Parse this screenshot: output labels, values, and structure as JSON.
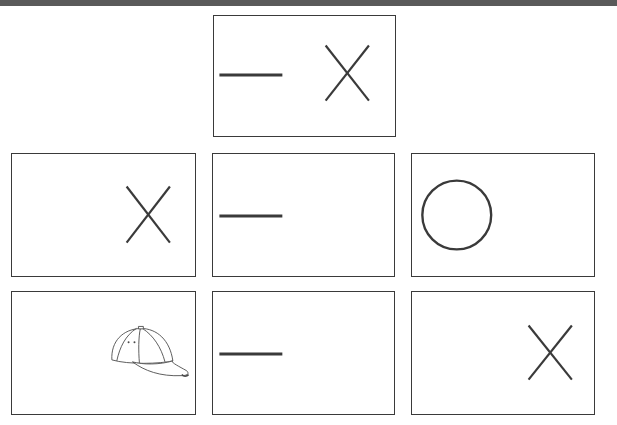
{
  "colors": {
    "stroke": "#3a3a3a",
    "top_bar": "#5a5a5a"
  },
  "top_card": {
    "label": "Example: dash and X",
    "symbols": [
      "dash",
      "x"
    ]
  },
  "grid": [
    {
      "label": "X",
      "symbol": "x"
    },
    {
      "label": "Dash",
      "symbol": "dash"
    },
    {
      "label": "Circle",
      "symbol": "circle"
    },
    {
      "label": "Cap",
      "symbol": "cap"
    },
    {
      "label": "Dash",
      "symbol": "dash"
    },
    {
      "label": "X",
      "symbol": "x"
    }
  ]
}
